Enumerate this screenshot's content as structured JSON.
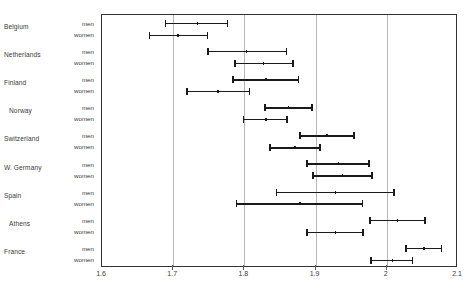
{
  "chart_data": {
    "type": "bar",
    "subtype": "interval-range-plot",
    "title": "",
    "xlabel": "",
    "ylabel": "",
    "xlim": [
      1.6,
      2.1
    ],
    "xticks": [
      1.6,
      1.7,
      1.8,
      1.9,
      2,
      2.1
    ],
    "xtick_labels": [
      "1.6",
      "1.7",
      "1.8",
      "1.9",
      "2",
      "2.1"
    ],
    "grid": "vertical",
    "legend": "none",
    "series_labels": [
      "men",
      "women"
    ],
    "categories": [
      "Belgium",
      "Netherlands",
      "Finland",
      "Norway",
      "Switzerland",
      "W. Germany",
      "Spain",
      "Athens",
      "France"
    ],
    "groups": [
      {
        "category": "Belgium",
        "rows": [
          {
            "label": "men",
            "low": 1.688,
            "center": 1.734,
            "high": 1.777
          },
          {
            "label": "women",
            "low": 1.666,
            "center": 1.707,
            "high": 1.749
          }
        ]
      },
      {
        "category": "Netherlands",
        "rows": [
          {
            "label": "men",
            "low": 1.748,
            "center": 1.803,
            "high": 1.86
          },
          {
            "label": "women",
            "low": 1.786,
            "center": 1.827,
            "high": 1.869
          }
        ]
      },
      {
        "category": "Finland",
        "rows": [
          {
            "label": "men",
            "low": 1.783,
            "center": 1.83,
            "high": 1.877
          },
          {
            "label": "women",
            "low": 1.718,
            "center": 1.763,
            "high": 1.808
          }
        ]
      },
      {
        "category": "Norway",
        "rows": [
          {
            "label": "men",
            "low": 1.828,
            "center": 1.862,
            "high": 1.896
          },
          {
            "label": "women",
            "low": 1.798,
            "center": 1.83,
            "high": 1.861
          }
        ]
      },
      {
        "category": "Switzerland",
        "rows": [
          {
            "label": "men",
            "low": 1.877,
            "center": 1.916,
            "high": 1.955
          },
          {
            "label": "women",
            "low": 1.835,
            "center": 1.871,
            "high": 1.907
          }
        ]
      },
      {
        "category": "W. Germany",
        "rows": [
          {
            "label": "men",
            "low": 1.887,
            "center": 1.932,
            "high": 1.976
          },
          {
            "label": "women",
            "low": 1.895,
            "center": 1.938,
            "high": 1.98
          }
        ]
      },
      {
        "category": "Spain",
        "rows": [
          {
            "label": "men",
            "low": 1.844,
            "center": 1.928,
            "high": 2.011
          },
          {
            "label": "women",
            "low": 1.788,
            "center": 1.878,
            "high": 1.967
          }
        ]
      },
      {
        "category": "Athens",
        "rows": [
          {
            "label": "men",
            "low": 1.975,
            "center": 2.015,
            "high": 2.055
          },
          {
            "label": "women",
            "low": 1.887,
            "center": 1.928,
            "high": 1.968
          }
        ]
      },
      {
        "category": "France",
        "rows": [
          {
            "label": "men",
            "low": 2.026,
            "center": 2.052,
            "high": 2.078
          },
          {
            "label": "women",
            "low": 1.977,
            "center": 2.008,
            "high": 2.037
          }
        ]
      }
    ]
  },
  "style": {
    "line_color": "#1a1a1a",
    "grid_color": "#b9b9b9",
    "axis_color": "#333333",
    "text_color": "#3a3a3a",
    "background": "#ffffff"
  }
}
